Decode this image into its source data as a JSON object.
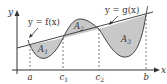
{
  "figure": {
    "axes": {
      "x_label": "x",
      "y_label": "y"
    },
    "curve_labels": {
      "f": "y = f(x)",
      "g": "y = g(x)"
    },
    "x_ticks": [
      {
        "id": "a",
        "label": "a"
      },
      {
        "id": "c1",
        "label": "c",
        "sub": "1"
      },
      {
        "id": "c2",
        "label": "c",
        "sub": "2"
      },
      {
        "id": "b",
        "label": "b"
      }
    ],
    "regions": [
      {
        "id": "A1",
        "label": "A",
        "sub": "1"
      },
      {
        "id": "A2",
        "label": "A",
        "sub": "2"
      },
      {
        "id": "A3",
        "label": "A",
        "sub": "3"
      }
    ],
    "colors": {
      "region_fill": "#c8c8c8",
      "line": "#444444",
      "axis": "#333333",
      "dashed": "#555555"
    }
  }
}
